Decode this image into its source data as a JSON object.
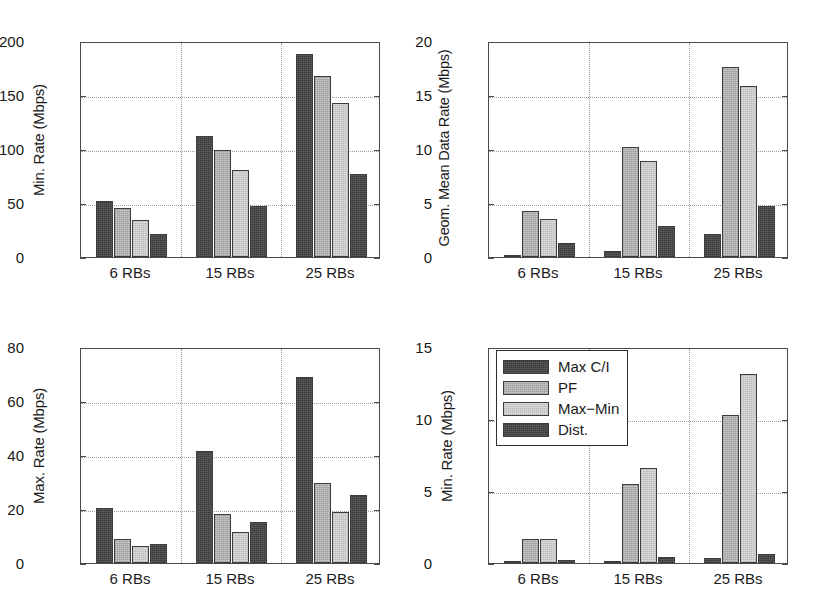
{
  "figure": {
    "background": "#ffffff",
    "series_colors": {
      "max_ci": "#3a3a3a",
      "pf": "#c9c9c9",
      "max_min": "#dddddd",
      "dist": "#3a3a3a"
    }
  },
  "legend": {
    "position": "top-left of bottom-right panel",
    "entries": [
      {
        "label": "Max C/I",
        "swatch": "dark"
      },
      {
        "label": "PF",
        "swatch": "medium"
      },
      {
        "label": "Max−Min",
        "swatch": "light"
      },
      {
        "label": "Dist.",
        "swatch": "dark"
      }
    ]
  },
  "chart_data": [
    {
      "id": "min-rate-top-left",
      "type": "bar",
      "title": "",
      "xlabel": "",
      "ylabel": "Min. Rate (Mbps)",
      "categories": [
        "6 RBs",
        "15 RBs",
        "25 RBs"
      ],
      "yticks": [
        0,
        50,
        100,
        150,
        200
      ],
      "ylim": [
        0,
        200
      ],
      "grid": true,
      "legend_visible": false,
      "series": [
        {
          "name": "Max C/I",
          "values": [
            52,
            112,
            188
          ]
        },
        {
          "name": "PF",
          "values": [
            45,
            99,
            168
          ]
        },
        {
          "name": "Max−Min",
          "values": [
            34,
            81,
            143
          ]
        },
        {
          "name": "Dist.",
          "values": [
            21,
            47,
            77
          ]
        }
      ]
    },
    {
      "id": "geom-mean-top-right",
      "type": "bar",
      "title": "",
      "xlabel": "",
      "ylabel": "Geom. Mean Data Rate (Mbps)",
      "categories": [
        "6 RBs",
        "15 RBs",
        "25 RBs"
      ],
      "yticks": [
        0,
        5,
        10,
        15,
        20
      ],
      "ylim": [
        0,
        20
      ],
      "grid": true,
      "legend_visible": false,
      "series": [
        {
          "name": "Max C/I",
          "values": [
            0.1,
            0.55,
            2.1
          ]
        },
        {
          "name": "PF",
          "values": [
            4.3,
            10.2,
            17.6
          ]
        },
        {
          "name": "Max−Min",
          "values": [
            3.5,
            8.9,
            15.8
          ]
        },
        {
          "name": "Dist.",
          "values": [
            1.3,
            2.9,
            4.7
          ]
        }
      ]
    },
    {
      "id": "max-rate-bottom-left",
      "type": "bar",
      "title": "",
      "xlabel": "",
      "ylabel": "Max. Rate (Mbps)",
      "categories": [
        "6 RBs",
        "15 RBs",
        "25 RBs"
      ],
      "yticks": [
        0,
        20,
        40,
        60,
        80
      ],
      "ylim": [
        0,
        80
      ],
      "grid": true,
      "legend_visible": false,
      "series": [
        {
          "name": "Max C/I",
          "values": [
            20.2,
            41.6,
            69.0
          ]
        },
        {
          "name": "PF",
          "values": [
            9.0,
            18.3,
            29.5
          ]
        },
        {
          "name": "Max−Min",
          "values": [
            6.2,
            11.5,
            19.0
          ]
        },
        {
          "name": "Dist.",
          "values": [
            7.0,
            15.2,
            25.2
          ]
        }
      ]
    },
    {
      "id": "min-rate-bottom-right",
      "type": "bar",
      "title": "",
      "xlabel": "",
      "ylabel": "Min. Rate (Mbps)",
      "categories": [
        "6 RBs",
        "15 RBs",
        "25 RBs"
      ],
      "yticks": [
        0,
        5,
        10,
        15
      ],
      "ylim": [
        0,
        15
      ],
      "grid": true,
      "legend_visible": true,
      "series": [
        {
          "name": "Max C/I",
          "values": [
            0.02,
            0.1,
            0.35
          ]
        },
        {
          "name": "PF",
          "values": [
            1.7,
            5.5,
            10.3
          ]
        },
        {
          "name": "Max−Min",
          "values": [
            1.7,
            6.6,
            13.1
          ]
        },
        {
          "name": "Dist.",
          "values": [
            0.2,
            0.4,
            0.65
          ]
        }
      ]
    }
  ]
}
